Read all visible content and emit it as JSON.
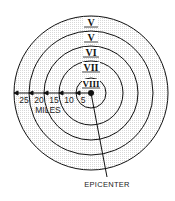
{
  "diagram": {
    "center": {
      "x": 91,
      "y": 93
    },
    "rings": [
      {
        "radius": 77,
        "intensity": "V"
      },
      {
        "radius": 62,
        "intensity": "V"
      },
      {
        "radius": 47,
        "intensity": "VI"
      },
      {
        "radius": 32,
        "intensity": "VII"
      },
      {
        "radius": 15,
        "intensity": "VIII"
      }
    ],
    "distance_labels": [
      "25",
      "20",
      "15",
      "10",
      "5"
    ],
    "units_label": "MILES",
    "epicenter_label": "EPICENTER",
    "colors": {
      "line": "#111111",
      "fill_pattern": "#e4e4e4",
      "background": "#ffffff"
    }
  }
}
